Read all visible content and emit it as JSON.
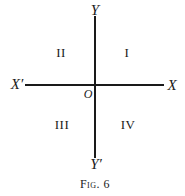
{
  "figure": {
    "caption": "Fig. 6",
    "axes": {
      "x_positive_label": "X",
      "x_negative_label": "X′",
      "y_positive_label": "Y",
      "y_negative_label": "Y′",
      "origin_label": "O"
    },
    "quadrants": [
      {
        "id": "I",
        "label": "I",
        "position": "upper-right"
      },
      {
        "id": "II",
        "label": "II",
        "position": "upper-left"
      },
      {
        "id": "III",
        "label": "III",
        "position": "lower-left"
      },
      {
        "id": "IV",
        "label": "IV",
        "position": "lower-right"
      }
    ],
    "colors": {
      "ink": "#1a1a1a",
      "background": "#ffffff"
    }
  }
}
